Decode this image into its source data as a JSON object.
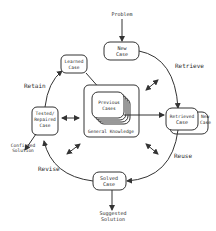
{
  "diagram": {
    "type": "cycle",
    "colors": {
      "stroke": "#333333",
      "text": "#2a2a2a",
      "background": "#ffffff"
    },
    "inputs": {
      "problem": "Problem"
    },
    "outputs": {
      "suggested_solution": [
        "Suggested",
        "Solution"
      ],
      "confirmed_solution": [
        "Confirmed",
        "Solution"
      ]
    },
    "nodes": {
      "new_case": [
        "New",
        "Case"
      ],
      "retrieved_case": [
        "Retrieved",
        "Case"
      ],
      "retrieved_new_case": [
        "New",
        "Case"
      ],
      "solved_case": [
        "Solved",
        "Case"
      ],
      "tested_case": [
        "Tested/",
        "Repaired",
        "Case"
      ],
      "learned_case": [
        "Learned",
        "Case"
      ],
      "previous_cases": [
        "Previous",
        "Cases"
      ],
      "general_knowledge": "General Knowledge"
    },
    "phases": {
      "retrieve": "Retrieve",
      "reuse": "Reuse",
      "revise": "Revise",
      "retain": "Retain"
    }
  }
}
